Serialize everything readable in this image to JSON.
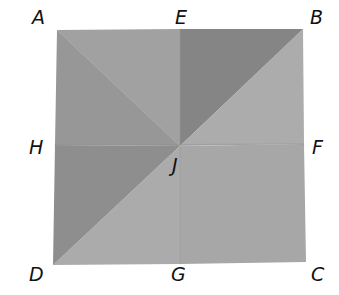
{
  "figure": {
    "points": {
      "A": {
        "label": "A",
        "x": 57,
        "y": 30
      },
      "E": {
        "label": "E",
        "x": 180,
        "y": 29
      },
      "B": {
        "label": "B",
        "x": 303,
        "y": 29
      },
      "H": {
        "label": "H",
        "x": 55,
        "y": 145
      },
      "J": {
        "label": "J",
        "x": 180,
        "y": 146
      },
      "F": {
        "label": "F",
        "x": 304,
        "y": 144
      },
      "D": {
        "label": "D",
        "x": 53,
        "y": 265
      },
      "G": {
        "label": "G",
        "x": 180,
        "y": 264
      },
      "C": {
        "label": "C",
        "x": 306,
        "y": 262
      }
    },
    "labels": {
      "A": "A",
      "E": "E",
      "B": "B",
      "H": "H",
      "F": "F",
      "J": "J",
      "D": "D",
      "G": "G",
      "C": "C"
    },
    "colors": {
      "background": "#ffffff",
      "region_AEJ": "#a1a1a1",
      "region_AJH": "#979797",
      "region_EBJ": "#858585",
      "region_BFJ": "#acacac",
      "region_HJD": "#8e8e8e",
      "region_JFCG": "#a7a7a7",
      "region_JGD": "#ababab",
      "crease": "#8a8a8a",
      "label": "#111111"
    }
  }
}
